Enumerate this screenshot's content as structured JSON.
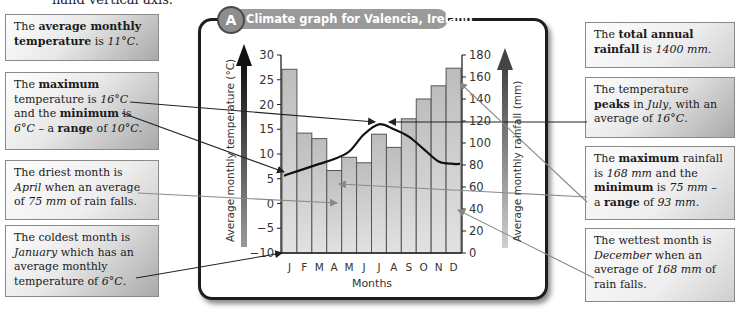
{
  "header": {
    "cut_text": "hand vertical axis."
  },
  "graph": {
    "badge_letter": "A",
    "title": "Climate graph for Valencia, Ireland"
  },
  "notes": {
    "left": [
      {
        "id": "avg-temp",
        "html": "The <b>average monthly temperature</b> is <i>11°C</i>."
      },
      {
        "id": "temp-range",
        "html": "The <b>maximum</b> temperature is <i>16°C</i> and the <b>minimum</b> is <i>6°C</i> – a <b>range</b> of <i>10°C</i>."
      },
      {
        "id": "driest",
        "html": "The driest month is <i>April</i> when an average of <i>75 mm</i> of rain falls."
      },
      {
        "id": "coldest",
        "html": "The coldest month is <i>January</i> which has an average monthly temperature of <i>6°C</i>."
      }
    ],
    "right": [
      {
        "id": "total-rain",
        "html": "The <b>total annual rainfall</b> is <i>1400 mm</i>."
      },
      {
        "id": "temp-peak",
        "html": "The temperature <b>peaks</b> in <i>July</i>, with an average of <i>16°C</i>."
      },
      {
        "id": "rain-range",
        "html": "The <b>maximum</b> rainfall is <i>168 mm</i> and the <b>minimum</b> is <i>75 mm</i> – a <b>range</b> of <i>93 mm</i>."
      },
      {
        "id": "wettest",
        "html": "The wettest month is <i>December</i> when an average of <i>168 mm</i> of rain falls."
      }
    ]
  },
  "chart_data": {
    "type": "bar+line",
    "title": "Climate graph for Valencia, Ireland",
    "categories": [
      "J",
      "F",
      "M",
      "A",
      "M",
      "J",
      "J",
      "A",
      "S",
      "O",
      "N",
      "D"
    ],
    "xlabel": "Months",
    "series": [
      {
        "name": "Average monthly rainfall (mm)",
        "type": "bar",
        "axis": "right",
        "values": [
          167,
          109,
          104,
          75,
          87,
          82,
          108,
          96,
          122,
          140,
          152,
          168
        ]
      },
      {
        "name": "Average monthly temperature (°C)",
        "type": "line",
        "axis": "left",
        "values": [
          6,
          7,
          8,
          9,
          10.5,
          14,
          16,
          15,
          13.5,
          11,
          8.5,
          8
        ]
      }
    ],
    "y_left": {
      "label": "Average monthly temperature (°C)",
      "range": [
        -10,
        30
      ],
      "ticks": [
        -10,
        -5,
        0,
        5,
        10,
        15,
        20,
        25,
        30
      ]
    },
    "y_right": {
      "label": "Average monthly rainfall (mm)",
      "range": [
        0,
        180
      ],
      "ticks": [
        0,
        20,
        40,
        60,
        80,
        100,
        120,
        140,
        160,
        180
      ]
    },
    "grid": false,
    "legend": "none"
  },
  "colors": {
    "bar_fill": "#c8c8c8",
    "bar_stroke": "#555555",
    "temp_line": "#111111",
    "note_leader_dark": "#222222",
    "note_leader_grey": "#8a8a8a",
    "badge": "#9a9a9a"
  }
}
